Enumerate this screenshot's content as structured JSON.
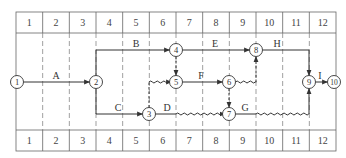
{
  "diagram": {
    "type": "time-scaled network diagram",
    "time_units": [
      "1",
      "2",
      "3",
      "4",
      "5",
      "6",
      "7",
      "8",
      "9",
      "10",
      "11",
      "12"
    ],
    "colors": {
      "line": "#333333",
      "grid": "#666666",
      "background": "#ffffff"
    },
    "nodes": [
      {
        "id": "1",
        "label": "1",
        "time": 0,
        "row": "middle"
      },
      {
        "id": "2",
        "label": "2",
        "time": 3,
        "row": "middle"
      },
      {
        "id": "3",
        "label": "3",
        "time": 5,
        "row": "bottom"
      },
      {
        "id": "4",
        "label": "4",
        "time": 6,
        "row": "top"
      },
      {
        "id": "5",
        "label": "5",
        "time": 6,
        "row": "middle"
      },
      {
        "id": "6",
        "label": "6",
        "time": 8,
        "row": "middle"
      },
      {
        "id": "7",
        "label": "7",
        "time": 8,
        "row": "bottom"
      },
      {
        "id": "8",
        "label": "8",
        "time": 9,
        "row": "top"
      },
      {
        "id": "9",
        "label": "9",
        "time": 11,
        "row": "middle"
      },
      {
        "id": "10",
        "label": "10",
        "time": 12,
        "row": "middle"
      }
    ],
    "activities": [
      {
        "label": "A",
        "from": "1",
        "to": "2",
        "duration": 3,
        "free_float": 0
      },
      {
        "label": "B",
        "from": "2",
        "to": "4",
        "duration": 3,
        "free_float": 0
      },
      {
        "label": "C",
        "from": "2",
        "to": "3",
        "duration": 2,
        "free_float": 0
      },
      {
        "label": "D",
        "from": "3",
        "to": "7",
        "duration": 1,
        "free_float": 2
      },
      {
        "label": "E",
        "from": "4",
        "to": "8",
        "duration": 3,
        "free_float": 0
      },
      {
        "label": "F",
        "from": "5",
        "to": "6",
        "duration": 2,
        "free_float": 0
      },
      {
        "label": "G",
        "from": "7",
        "to": "9",
        "duration": 1,
        "free_float": 2
      },
      {
        "label": "H",
        "from": "8",
        "to": "9",
        "duration": 2,
        "free_float": 0
      },
      {
        "label": "I",
        "from": "9",
        "to": "10",
        "duration": 1,
        "free_float": 0
      }
    ],
    "dummies": [
      {
        "from": "4",
        "to": "5"
      },
      {
        "from": "3",
        "to": "5",
        "wavy_float": 1
      },
      {
        "from": "6",
        "to": "7"
      },
      {
        "from": "6",
        "to": "8",
        "wavy_float": 1
      }
    ]
  }
}
